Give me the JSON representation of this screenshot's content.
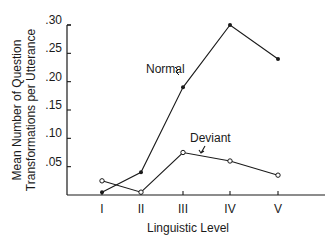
{
  "chart_data": {
    "type": "line",
    "title": "",
    "xlabel": "Linguistic Level",
    "ylabel_lines": [
      "Mean Number of Question",
      "Transformations per Utterance"
    ],
    "ylabel": "Mean Number of Question Transformations per Utterance",
    "categories": [
      "I",
      "II",
      "III",
      "IV",
      "V"
    ],
    "y_ticks": [
      ".05",
      ".10",
      ".15",
      ".20",
      ".25",
      ".30"
    ],
    "y_tick_values": [
      0.05,
      0.1,
      0.15,
      0.2,
      0.25,
      0.3
    ],
    "ylim": [
      0,
      0.3
    ],
    "grid": false,
    "legend_position": "inline annotations",
    "series": [
      {
        "name": "Normal",
        "marker": "filled-dot",
        "values": [
          0.005,
          0.04,
          0.19,
          0.3,
          0.24
        ]
      },
      {
        "name": "Deviant",
        "marker": "open-circle",
        "values": [
          0.025,
          0.005,
          0.075,
          0.06,
          0.035
        ]
      }
    ],
    "annotations": [
      {
        "text": "Normal",
        "series": "Normal"
      },
      {
        "text": "Deviant",
        "series": "Deviant"
      }
    ]
  },
  "colors": {
    "ink": "#1a1a1a",
    "background": "#ffffff"
  }
}
